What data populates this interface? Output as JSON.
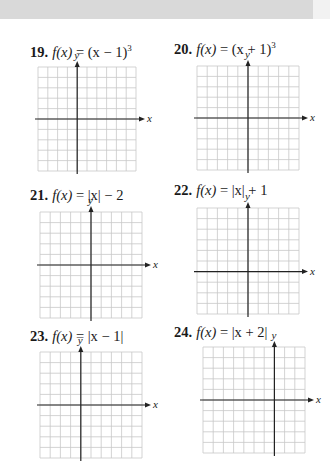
{
  "page": {
    "background": "#ffffff",
    "top_band_color": "#d9d9d9",
    "grid_line_color": "#c8c8c8",
    "axis_color": "#222222"
  },
  "problems": [
    {
      "number": "19.",
      "fname": "f(x)",
      "equals": " = ",
      "expr_main": "(x − 1)",
      "exponent": "3",
      "axis_x_label": "x",
      "axis_y_label": "y",
      "grid": {
        "left": 38,
        "top": 67,
        "width": 98,
        "height": 104,
        "cols": 10,
        "rows": 10,
        "y_axis_col": 4,
        "x_axis_row": 5
      }
    },
    {
      "number": "20.",
      "fname": "f(x)",
      "equals": " = ",
      "expr_main": "(x + 1)",
      "exponent": "3",
      "axis_x_label": "x",
      "axis_y_label": "y",
      "grid": {
        "left": 197,
        "top": 66,
        "width": 102,
        "height": 104,
        "cols": 10,
        "rows": 10,
        "y_axis_col": 5,
        "x_axis_row": 5
      }
    },
    {
      "number": "21.",
      "fname": "f(x)",
      "equals": " = ",
      "expr_main": "|x| − 2",
      "exponent": "",
      "axis_x_label": "x",
      "axis_y_label": "y",
      "grid": {
        "left": 40,
        "top": 212,
        "width": 102,
        "height": 106,
        "cols": 10,
        "rows": 10,
        "y_axis_col": 5,
        "x_axis_row": 5
      }
    },
    {
      "number": "22.",
      "fname": "f(x)",
      "equals": " = ",
      "expr_main": "|x| + 1",
      "exponent": "",
      "axis_x_label": "x",
      "axis_y_label": "y",
      "grid": {
        "left": 197,
        "top": 208,
        "width": 102,
        "height": 106,
        "cols": 10,
        "rows": 10,
        "y_axis_col": 5,
        "x_axis_row": 6
      }
    },
    {
      "number": "23.",
      "fname": "f(x)",
      "equals": " = ",
      "expr_main": "|x − 1|",
      "exponent": "",
      "axis_x_label": "x",
      "axis_y_label": "y",
      "grid": {
        "left": 40,
        "top": 352,
        "width": 102,
        "height": 106,
        "cols": 10,
        "rows": 10,
        "y_axis_col": 4,
        "x_axis_row": 5
      }
    },
    {
      "number": "24.",
      "fname": "f(x)",
      "equals": " = ",
      "expr_main": "|x + 2|",
      "exponent": "",
      "axis_x_label": "x",
      "axis_y_label": "y",
      "grid": {
        "left": 203,
        "top": 347,
        "width": 102,
        "height": 106,
        "cols": 10,
        "rows": 10,
        "y_axis_col": 7,
        "x_axis_row": 5
      }
    }
  ]
}
